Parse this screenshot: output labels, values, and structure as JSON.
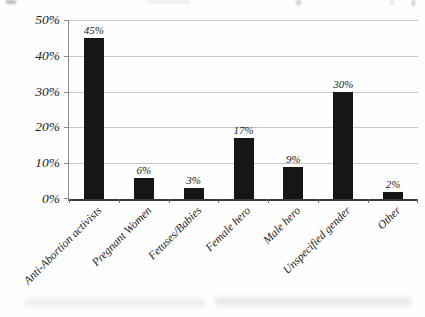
{
  "chart_data": {
    "type": "bar",
    "title": "",
    "xlabel": "",
    "ylabel": "",
    "categories": [
      "Anti-Abortion activists",
      "Pregnant Women",
      "Fetuses/Babies",
      "Female hero",
      "Male hero",
      "Unspecified gender",
      "Other"
    ],
    "values": [
      45,
      6,
      3,
      17,
      9,
      30,
      2
    ],
    "value_labels": [
      "45%",
      "6%",
      "3%",
      "17%",
      "9%",
      "30%",
      "2%"
    ],
    "y_ticks_top_to_bottom": [
      "50%",
      "40%",
      "30%",
      "20%",
      "10%",
      "0%"
    ],
    "ylim": [
      0,
      50
    ],
    "y_tick_step": 10,
    "grid": "horizontal",
    "legend": "none",
    "bar_color": "#161616",
    "gridline_color": "#c6c6c6",
    "axis_color": "#3a3a3a"
  }
}
